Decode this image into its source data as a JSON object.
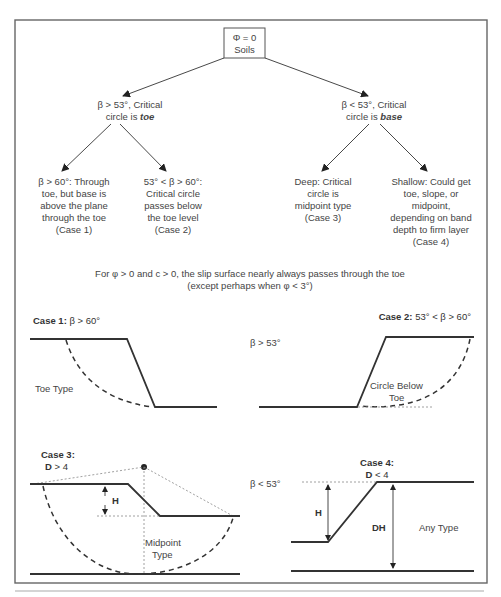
{
  "root": {
    "line1": "Φ = 0",
    "line2": "Soils"
  },
  "branches": {
    "left": {
      "line1": "β > 53°, Critical",
      "line2_prefix": "circle is ",
      "line2_emph": "toe"
    },
    "right": {
      "line1": "β < 53°, Critical",
      "line2_prefix": "circle is ",
      "line2_emph": "base"
    }
  },
  "leaves": [
    {
      "lines": [
        "β > 60°:  Through",
        "toe, but base is",
        "above the plane",
        "through the toe",
        "(Case 1)"
      ]
    },
    {
      "lines": [
        "53° < β > 60°:",
        "Critical circle",
        "passes below",
        "the toe level",
        "(Case 2)"
      ]
    },
    {
      "lines": [
        "Deep:  Critical",
        "circle is",
        "midpoint type",
        "(Case 3)"
      ]
    },
    {
      "lines": [
        "Shallow:  Could get",
        "toe, slope, or",
        "midpoint,",
        "depending on band",
        "depth to firm layer",
        "(Case 4)"
      ]
    }
  ],
  "note": {
    "line1": "For φ > 0 and c > 0, the slip surface nearly always passes through the toe",
    "line2": "(except perhaps when φ < 3°)"
  },
  "cases": {
    "case1": {
      "title_bold": "Case 1:",
      "title_rest": "  β > 60°",
      "label": "Toe Type"
    },
    "case2": {
      "title_bold": "Case 2:",
      "title_rest": "  53° < β > 60°",
      "label1": "Circle Below",
      "label2": "Toe"
    },
    "case3": {
      "title_bold": "Case 3:",
      "sub_bold": "D",
      "sub_rest": " > 4",
      "h_label": "H",
      "label1": "Midpoint",
      "label2": "Type"
    },
    "case4": {
      "title_bold": "Case 4:",
      "sub_bold": "D",
      "sub_rest": " < 4",
      "h_label": "H",
      "dh_label": "DH",
      "label": "Any Type"
    }
  },
  "row_labels": {
    "upper": "β > 53°",
    "lower": "β < 53°"
  }
}
